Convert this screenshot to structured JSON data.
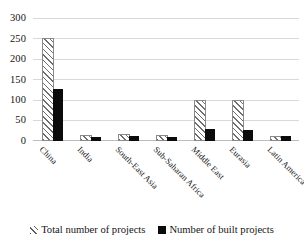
{
  "chart_data": {
    "type": "bar",
    "title": "",
    "xlabel": "",
    "ylabel": "",
    "ylim": [
      0,
      300
    ],
    "yticks": [
      0,
      50,
      100,
      150,
      200,
      250,
      300
    ],
    "grid": true,
    "legend_position": "bottom",
    "categories": [
      "China",
      "India",
      "South-East Asia",
      "Sub-Saharan Africa",
      "Middle East",
      "Eurasia",
      "Latin America"
    ],
    "series": [
      {
        "name": "Total number of projects",
        "style": "hatched",
        "color": "#6e6e6e",
        "values": [
          248,
          11,
          13,
          9,
          95,
          95,
          8
        ]
      },
      {
        "name": "Number of built projects",
        "style": "solid",
        "color": "#0b0b0b",
        "values": [
          127,
          10,
          13,
          10,
          30,
          28,
          13
        ]
      }
    ]
  },
  "axis": {
    "yticks": [
      "300",
      "250",
      "200",
      "150",
      "100",
      "50",
      "0"
    ]
  },
  "legend": {
    "items": [
      {
        "label": "Total number of projects",
        "swatch": "hatch-swatch-icon"
      },
      {
        "label": "Number of built projects",
        "swatch": "solid-swatch-icon"
      }
    ]
  }
}
